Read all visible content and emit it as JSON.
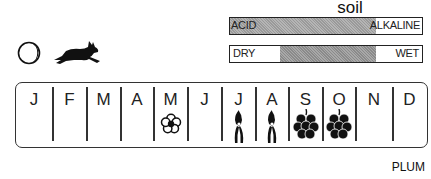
{
  "icons": {
    "moon": "circle-moon-icon",
    "hare": "running-hare-icon"
  },
  "soil": {
    "title": "soil",
    "ph_bar": {
      "left_label": "ACID",
      "right_label": "ALKALINE",
      "fill_start_pct": 0,
      "fill_end_pct": 76
    },
    "moisture_bar": {
      "left_label": "DRY",
      "right_label": "WET",
      "fill_start_pct": 26,
      "fill_end_pct": 76
    }
  },
  "calendar": {
    "months": [
      {
        "label": "J",
        "icon": ""
      },
      {
        "label": "F",
        "icon": ""
      },
      {
        "label": "M",
        "icon": ""
      },
      {
        "label": "A",
        "icon": ""
      },
      {
        "label": "M",
        "icon": "flower"
      },
      {
        "label": "J",
        "icon": ""
      },
      {
        "label": "J",
        "icon": "pruning-shears"
      },
      {
        "label": "A",
        "icon": "pruning-shears"
      },
      {
        "label": "S",
        "icon": "fruit-cluster"
      },
      {
        "label": "O",
        "icon": "fruit-cluster"
      },
      {
        "label": "N",
        "icon": ""
      },
      {
        "label": "D",
        "icon": ""
      }
    ]
  },
  "plant_name": "PLUM"
}
